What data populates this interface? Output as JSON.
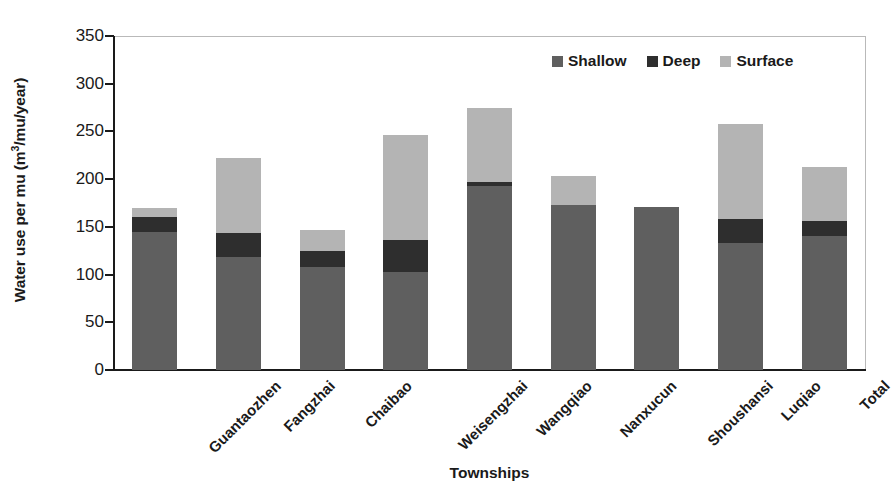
{
  "chart_data": {
    "type": "bar",
    "subtype": "stacked-bar",
    "title": "",
    "xlabel": "Townships",
    "ylabel": "Water use per mu (m3/mu/year)",
    "ylabel_html": "Water use per mu (m<sup>3</sup>/mu/year)",
    "ylim": [
      0,
      350
    ],
    "ytick_values": [
      0,
      50,
      100,
      150,
      200,
      250,
      300,
      350
    ],
    "ytick_labels": [
      "0",
      "50",
      "100",
      "150",
      "200",
      "250",
      "300",
      "350"
    ],
    "grid": false,
    "legend_position": "top-right-inside",
    "categories": [
      "Guantaozhen",
      "Fangzhai",
      "Chaibao",
      "Weisengzhai",
      "Wangqiao",
      "Nanxucun",
      "Shoushansi",
      "Luqiao",
      "Total"
    ],
    "series": [
      {
        "name": "Shallow",
        "color": "#5f5f5f",
        "values": [
          145,
          118,
          108,
          103,
          193,
          173,
          171,
          133,
          140
        ]
      },
      {
        "name": "Deep",
        "color": "#2e2e2e",
        "values": [
          15,
          26,
          17,
          33,
          4,
          0,
          0,
          25,
          16
        ]
      },
      {
        "name": "Surface",
        "color": "#b4b4b4",
        "values": [
          10,
          78,
          22,
          110,
          78,
          30,
          0,
          100,
          57
        ]
      }
    ],
    "totals": [
      170,
      222,
      147,
      246,
      275,
      203,
      171,
      258,
      213
    ]
  },
  "legend": {
    "items": [
      {
        "label": "Shallow",
        "color": "#5f5f5f"
      },
      {
        "label": "Deep",
        "color": "#2e2e2e"
      },
      {
        "label": "Surface",
        "color": "#b4b4b4"
      }
    ]
  },
  "axes": {
    "x_title": "Townships",
    "y_title_prefix": "Water use per mu (m",
    "y_title_sup": "3",
    "y_title_suffix": "/mu/year)"
  },
  "colors": {
    "shallow": "#5f5f5f",
    "deep": "#2e2e2e",
    "surface": "#b4b4b4",
    "axis": "#1a1a1a",
    "frame": "#b9b9b9",
    "background": "#ffffff"
  }
}
